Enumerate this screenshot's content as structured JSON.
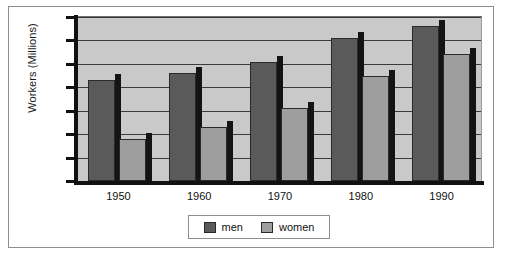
{
  "chart_data": {
    "type": "bar",
    "title": "",
    "xlabel": "",
    "ylabel": "Workers (Millions)",
    "categories": [
      "1950",
      "1960",
      "1970",
      "1980",
      "1990"
    ],
    "series": [
      {
        "name": "men",
        "color": "#5a5a5a",
        "values": [
          43,
          46,
          51,
          61,
          66
        ]
      },
      {
        "name": "women",
        "color": "#9e9e9e",
        "values": [
          18,
          23,
          31,
          45,
          54
        ]
      }
    ],
    "ylim": [
      0,
      70
    ],
    "ytick_labels": [
      "70",
      "60",
      "50",
      "40",
      "30",
      "20",
      "10",
      "0"
    ],
    "ytick_values": [
      70,
      60,
      50,
      40,
      30,
      20,
      10,
      0
    ],
    "ytick_step": 10,
    "grid": true,
    "grid_axis": "y",
    "legend_position": "bottom-center",
    "legend_entries": [
      "men",
      "women"
    ],
    "plot_background": "#c9c9c9",
    "figure_background": "#ffffff",
    "axis_color": "#111111",
    "bar_style": "3d-shadowed"
  }
}
